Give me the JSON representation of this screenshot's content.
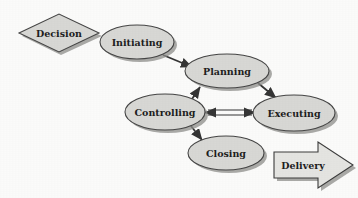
{
  "diagram": {
    "background_color": "#fdfdfc",
    "shape_fill_color": "#d9d9d6",
    "shape_border_color": "#444444",
    "shape_shadow_color": "#8e8e8b",
    "text_color": "#1c1c1c",
    "connector_color": "#333333"
  },
  "nodes": {
    "decision": {
      "label": "Decision",
      "shape": "diamond",
      "cx": 59,
      "cy": 33,
      "rx": 41,
      "ry": 19,
      "font_size": 9.5
    },
    "initiating": {
      "label": "Initiating",
      "shape": "ellipse",
      "cx": 137,
      "cy": 42,
      "rx": 37,
      "ry": 17,
      "font_size": 9.5
    },
    "planning": {
      "label": "Planning",
      "shape": "ellipse",
      "cx": 227,
      "cy": 71,
      "rx": 42,
      "ry": 17,
      "font_size": 9.5
    },
    "controlling": {
      "label": "Controlling",
      "shape": "ellipse",
      "cx": 165,
      "cy": 112,
      "rx": 40,
      "ry": 18,
      "font_size": 9.5
    },
    "executing": {
      "label": "Executing",
      "shape": "ellipse",
      "cx": 294,
      "cy": 113,
      "rx": 41,
      "ry": 18,
      "font_size": 9.5
    },
    "closing": {
      "label": "Closing",
      "shape": "ellipse",
      "cx": 226,
      "cy": 153,
      "rx": 38,
      "ry": 17,
      "font_size": 9.5
    },
    "delivery": {
      "label": "Delivery",
      "shape": "block-arrow-right",
      "cx": 305,
      "cy": 165,
      "font_size": 9.5
    }
  },
  "connections": [
    {
      "name": "initiating-to-planning",
      "from": "initiating",
      "to": "planning",
      "arrow": "single"
    },
    {
      "name": "planning-to-executing",
      "from": "planning",
      "to": "executing",
      "arrow": "single"
    },
    {
      "name": "controlling-to-planning",
      "from": "controlling",
      "to": "planning",
      "arrow": "single"
    },
    {
      "name": "controlling-executing-bidirectional",
      "from": "controlling",
      "to": "executing",
      "arrow": "double"
    },
    {
      "name": "controlling-to-closing",
      "from": "controlling",
      "to": "closing",
      "arrow": "single"
    }
  ]
}
